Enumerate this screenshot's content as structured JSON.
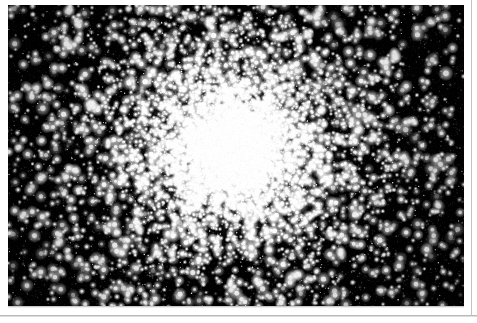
{
  "page": {
    "width": 477,
    "height": 323,
    "background_color": "#ffffff",
    "caption": ""
  },
  "rules": {
    "bottom_rule_color": "#b9b9b9",
    "right_rule_color": "#c2c2c2"
  },
  "plate": {
    "name": "globular-cluster-photograph",
    "x": 8,
    "y": 5,
    "width": 456,
    "height": 301,
    "background_color": "#000000",
    "star_color": "#ffffff",
    "subject": "globular star cluster",
    "alt_text": "Black and white astronomical photograph of a globular star cluster: a dense, bright, unresolved core surrounded by thousands of resolved point stars thinning out toward the dark edges of the frame."
  },
  "chart_data": {
    "type": "scatter",
    "title": "",
    "xlabel": "",
    "ylabel": "",
    "grid": false,
    "legend": null,
    "xlim": [
      0,
      456
    ],
    "ylim": [
      0,
      301
    ],
    "background": "#000000",
    "point_color": "#ffffff",
    "cluster": {
      "center_x": 224,
      "center_y": 143,
      "core_radius": 30,
      "halo_radius": 118,
      "core_peak_brightness": 0.86,
      "ellipticity": 0.92,
      "position_angle_deg": 12
    },
    "populations": [
      {
        "name": "core-glow",
        "kind": "gaussian-haze",
        "count": 1,
        "sigma": 52,
        "peak": 0.82
      },
      {
        "name": "core-stars",
        "kind": "points",
        "count": 4200,
        "radius_sigma": 34,
        "size_min": 1,
        "size_max": 2.6,
        "brightness_min": 0.45,
        "brightness_max": 1.0
      },
      {
        "name": "halo-stars",
        "kind": "points",
        "count": 2600,
        "radius_sigma": 78,
        "size_min": 1,
        "size_max": 3.2,
        "brightness_min": 0.35,
        "brightness_max": 1.0
      },
      {
        "name": "outskirt-stars",
        "kind": "points",
        "count": 1500,
        "radius_sigma": 150,
        "size_min": 1.2,
        "size_max": 3.8,
        "brightness_min": 0.4,
        "brightness_max": 1.0
      },
      {
        "name": "field-stars",
        "kind": "uniform-points",
        "count": 1700,
        "size_min": 0.7,
        "size_max": 3.6,
        "brightness_min": 0.18,
        "brightness_max": 1.0
      },
      {
        "name": "faint-grain",
        "kind": "uniform-points",
        "count": 5200,
        "size_min": 0.5,
        "size_max": 1.1,
        "brightness_min": 0.06,
        "brightness_max": 0.3
      }
    ],
    "seed": 20240517
  }
}
